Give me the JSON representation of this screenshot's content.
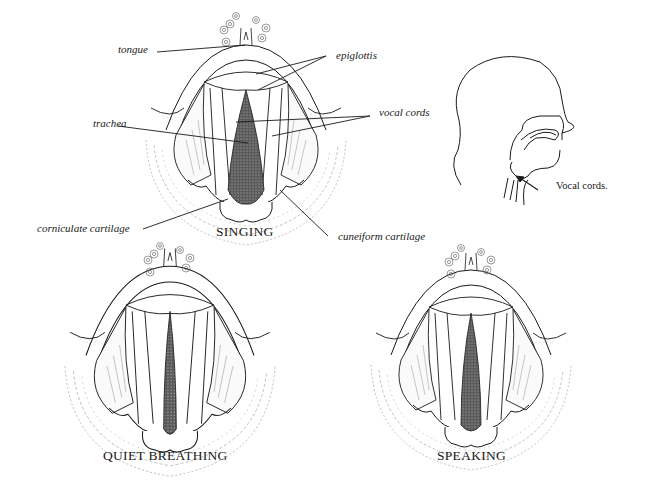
{
  "figure": {
    "panels": [
      {
        "id": "singing",
        "caption": "SINGING",
        "labels": {
          "tongue": "tongue",
          "epiglottis": "epiglottis",
          "vocal_cords": "vocal cords",
          "trachea": "trachea",
          "corniculate_cartilage": "corniculate cartilage",
          "cuneiform_cartilage": "cuneiform cartilage"
        }
      },
      {
        "id": "quiet-breathing",
        "caption": "QUIET BREATHING"
      },
      {
        "id": "speaking",
        "caption": "SPEAKING"
      }
    ],
    "head_profile": {
      "label": "Vocal cords."
    }
  },
  "colors": {
    "ink": "#1a1a1a",
    "background": "#ffffff",
    "stipple": "#555555"
  }
}
